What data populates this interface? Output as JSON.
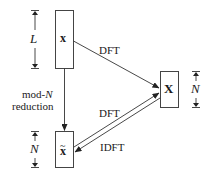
{
  "diagram": {
    "nodes": {
      "x": {
        "label": "x",
        "style": "bold"
      },
      "X": {
        "label": "X",
        "style": "bold"
      },
      "x_tilde": {
        "label": "x",
        "accent": "~",
        "style": "bold"
      }
    },
    "edges": {
      "x_to_X": {
        "label": "DFT"
      },
      "xt_to_X": {
        "label": "DFT"
      },
      "X_to_xt": {
        "label": "IDFT"
      },
      "x_to_xt": {
        "label_line1": "mod-",
        "label_italic": "N",
        "label_line2": "reduction"
      }
    },
    "dimensions": {
      "x_length": "L",
      "X_length": "N",
      "x_tilde_length": "N"
    }
  },
  "colors": {
    "stroke": "#333333",
    "background": "#ffffff"
  }
}
